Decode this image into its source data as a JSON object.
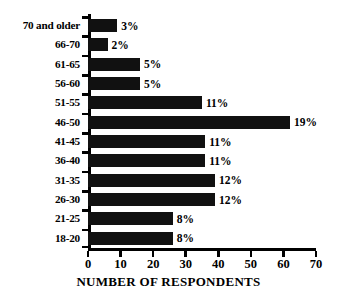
{
  "chart_data": {
    "type": "bar",
    "orientation": "horizontal",
    "title": "",
    "xlabel": "NUMBER OF RESPONDENTS",
    "ylabel": "",
    "xlim": [
      0,
      70
    ],
    "xticks": [
      0,
      10,
      20,
      30,
      40,
      50,
      60,
      70
    ],
    "grid": false,
    "legend": false,
    "bar_color": "#111111",
    "axis_color": "#000000",
    "background": "#ffffff",
    "categories": [
      "70 and older",
      "66-70",
      "61-65",
      "56-60",
      "51-55",
      "46-50",
      "41-45",
      "36-40",
      "31-35",
      "26-30",
      "21-25",
      "18-20"
    ],
    "values": [
      9,
      6,
      16,
      16,
      35,
      62,
      36,
      36,
      39,
      39,
      26,
      26
    ],
    "data_labels": [
      "3%",
      "2%",
      "5%",
      "5%",
      "11%",
      "19%",
      "11%",
      "11%",
      "12%",
      "12%",
      "8%",
      "8%"
    ],
    "percentages": [
      3,
      2,
      5,
      5,
      11,
      19,
      11,
      11,
      12,
      12,
      8,
      8
    ]
  }
}
